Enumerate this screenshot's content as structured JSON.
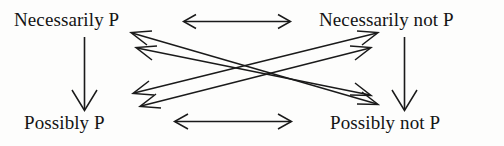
{
  "figure": {
    "background_color": "#fdfdfc",
    "ink_color": "#1a1a1a"
  },
  "corners": {
    "top_left": {
      "label": "Necessarily P"
    },
    "top_right": {
      "label": "Necessarily not P"
    },
    "bottom_left": {
      "label": "Possibly P"
    },
    "bottom_right": {
      "label": "Possibly not P"
    }
  },
  "arrows": [
    {
      "name": "top-horizontal-arrow",
      "glyph": "double-headed-horizontal-arrow",
      "from": "Necessarily P",
      "to": "Necessarily not P"
    },
    {
      "name": "bottom-horizontal-arrow",
      "glyph": "double-headed-horizontal-arrow",
      "from": "Possibly P",
      "to": "Possibly not P"
    },
    {
      "name": "left-vertical-arrow",
      "glyph": "down-arrow",
      "from": "Necessarily P",
      "to": "Possibly P"
    },
    {
      "name": "right-vertical-arrow",
      "glyph": "down-arrow",
      "from": "Necessarily not P",
      "to": "Possibly not P"
    },
    {
      "name": "diagonal-arrow-upper-nw-se",
      "glyph": "double-headed-diagonal-arrow",
      "from": "Necessarily P",
      "to": "Possibly not P"
    },
    {
      "name": "diagonal-arrow-lower-nw-se",
      "glyph": "double-headed-diagonal-arrow",
      "from": "Necessarily P",
      "to": "Possibly not P"
    },
    {
      "name": "diagonal-arrow-upper-sw-ne",
      "glyph": "double-headed-diagonal-arrow",
      "from": "Possibly P",
      "to": "Necessarily not P"
    },
    {
      "name": "diagonal-arrow-lower-sw-ne",
      "glyph": "double-headed-diagonal-arrow",
      "from": "Possibly P",
      "to": "Necessarily not P"
    }
  ]
}
